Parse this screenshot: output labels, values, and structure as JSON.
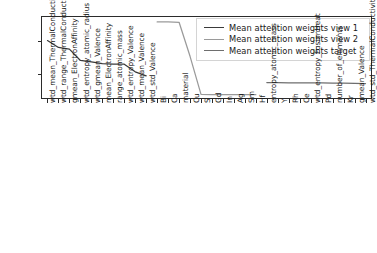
{
  "chart_data": {
    "type": "line",
    "title": "",
    "xlabel": "",
    "ylabel": "",
    "ylim": [
      0.005,
      0.0555
    ],
    "xlim": [
      -0.5,
      29.5
    ],
    "grid": false,
    "legend_position": "upper right",
    "categories": [
      "wtd_mean_ThermalConductivity",
      "wtd_range_ThermalConductivity",
      "gmean_ElectronAffinity",
      "wtd_entropy_atomic_radius",
      "wtd_gmean_Valence",
      "mean_ElectronAffinity",
      "range_atomic_mass",
      "wtd_entropy_Valence",
      "wtd_mean_Valence",
      "wtd_std_Valence",
      "Bi",
      "Ca",
      "material",
      "Cu",
      "S",
      "Gd",
      "In",
      "Ag",
      "Sm",
      "Hf",
      "entropy_atomic_mass",
      "Y",
      "Rh",
      "Ce",
      "wtd_entropy_FusionHeat",
      "Pd",
      "number_of_elements",
      "Kr",
      "gmean_Valence",
      "wtd_std_ThermalConductivity"
    ],
    "series": [
      {
        "name": "Mean attention weights view 1",
        "color": "#3a3a3a",
        "x": [
          0,
          1,
          2,
          3,
          4,
          5,
          6,
          7,
          8,
          9
        ],
        "values": [
          0.0408,
          0.0365,
          0.0355,
          0.0284,
          0.0275,
          0.0264,
          0.0261,
          0.0261,
          0.0213,
          0.0188
        ]
      },
      {
        "name": "Mean attention weights view 2",
        "color": "#9a9a9a",
        "x": [
          10,
          11,
          12,
          13,
          14,
          15,
          16,
          17,
          18,
          19
        ],
        "values": [
          0.0524,
          0.0524,
          0.0522,
          0.031,
          0.0073,
          0.0071,
          0.0071,
          0.0071,
          0.0071,
          0.0071
        ]
      },
      {
        "name": "Mean attention weights target",
        "color": "#6e6e6e",
        "x": [
          20,
          21,
          22,
          23,
          24,
          25,
          26,
          27,
          28,
          29
        ],
        "values": [
          0.0146,
          0.0146,
          0.0145,
          0.0145,
          0.0145,
          0.0144,
          0.0143,
          0.0142,
          0.0141,
          0.014
        ]
      }
    ],
    "yticks": [
      0.02,
      0.04
    ],
    "ytick_labels": [
      "0.02",
      "0.04"
    ]
  },
  "legend": {
    "entries": [
      {
        "label": "Mean attention weights view 1",
        "color": "#3a3a3a"
      },
      {
        "label": "Mean attention weights view 2",
        "color": "#9a9a9a"
      },
      {
        "label": "Mean attention weights target",
        "color": "#6e6e6e"
      }
    ]
  },
  "axes": {
    "y_tick_labels": [
      "0.04",
      "0.02"
    ]
  }
}
